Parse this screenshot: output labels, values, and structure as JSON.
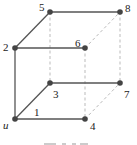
{
  "diagram": {
    "type": "graph",
    "colors": {
      "solid_edge": "#555555",
      "dashed_edge": "#bbbbbb",
      "node": "#444444",
      "label": "#222222"
    },
    "nodes": [
      {
        "id": "u",
        "label": "u",
        "x": 15,
        "y": 119
      },
      {
        "id": "2",
        "label": "2",
        "x": 15,
        "y": 48
      },
      {
        "id": "3",
        "label": "3",
        "x": 50,
        "y": 83
      },
      {
        "id": "4",
        "label": "4",
        "x": 85,
        "y": 119
      },
      {
        "id": "5",
        "label": "5",
        "x": 50,
        "y": 12
      },
      {
        "id": "6",
        "label": "6",
        "x": 85,
        "y": 48
      },
      {
        "id": "7",
        "label": "7",
        "x": 120,
        "y": 83
      },
      {
        "id": "8",
        "label": "8",
        "x": 120,
        "y": 12
      }
    ],
    "edges_solid": [
      [
        "u",
        "2"
      ],
      [
        "u",
        "3"
      ],
      [
        "u",
        "4"
      ],
      [
        "2",
        "5"
      ],
      [
        "2",
        "6"
      ],
      [
        "5",
        "8"
      ],
      [
        "3",
        "7"
      ]
    ],
    "edges_dashed": [
      [
        "5",
        "3"
      ],
      [
        "8",
        "7"
      ],
      [
        "6",
        "4"
      ],
      [
        "6",
        "8"
      ],
      [
        "4",
        "7"
      ]
    ],
    "edge_labels": [
      {
        "edge": [
          "u",
          "4"
        ],
        "text": "1"
      }
    ]
  }
}
